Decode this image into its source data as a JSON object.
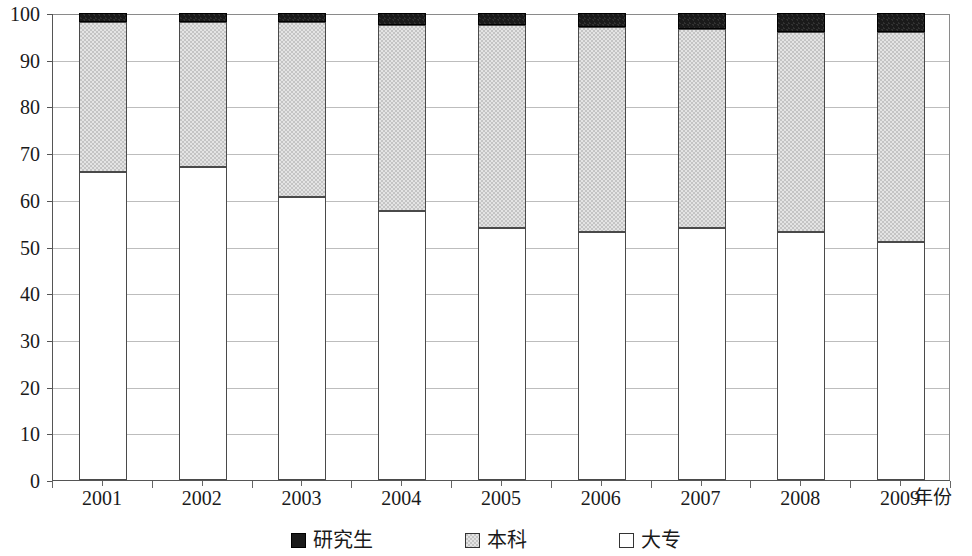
{
  "chart_data": {
    "type": "bar",
    "stacked": true,
    "title": "",
    "subtitle": "",
    "xlabel": "年份",
    "ylabel": "",
    "categories": [
      "2001",
      "2002",
      "2003",
      "2004",
      "2005",
      "2006",
      "2007",
      "2008",
      "2009"
    ],
    "series": [
      {
        "name": "大专",
        "color": "#ffffff",
        "values": [
          66,
          67,
          60.5,
          57.5,
          54,
          53,
          54,
          53,
          51
        ]
      },
      {
        "name": "本科",
        "color": "#c4c4c4",
        "values": [
          32,
          31,
          37.5,
          40,
          43.5,
          44,
          42.5,
          43,
          45
        ]
      },
      {
        "name": "研究生",
        "color": "#1a1a1a",
        "values": [
          2,
          2,
          2,
          2.5,
          2.5,
          3,
          3.5,
          4,
          4
        ]
      }
    ],
    "ylim": [
      0,
      100
    ],
    "yticks": [
      0,
      10,
      20,
      30,
      40,
      50,
      60,
      70,
      80,
      90,
      100
    ],
    "ytick_labels": [
      "0",
      "10",
      "20",
      "30",
      "40",
      "50",
      "60",
      "70",
      "80",
      "90",
      "100"
    ],
    "grid": true,
    "grid_axis": "y",
    "legend_position": "bottom",
    "legend": [
      {
        "label": "研究生",
        "swatch": "black-filled-square"
      },
      {
        "label": "本科",
        "swatch": "gray-filled-square"
      },
      {
        "label": "大专",
        "swatch": "white-empty-square"
      }
    ]
  },
  "axis": {
    "x_title": "年份"
  }
}
